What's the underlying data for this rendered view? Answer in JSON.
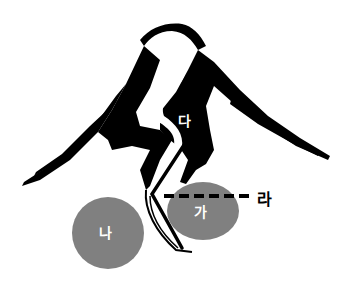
{
  "diagram": {
    "labels": {
      "ga": "가",
      "na": "나",
      "da": "다",
      "ra": "라"
    },
    "colors": {
      "ink": "#000000",
      "circle_fill": "#808080",
      "circle_text": "#ffffff",
      "background": "#ffffff"
    }
  }
}
